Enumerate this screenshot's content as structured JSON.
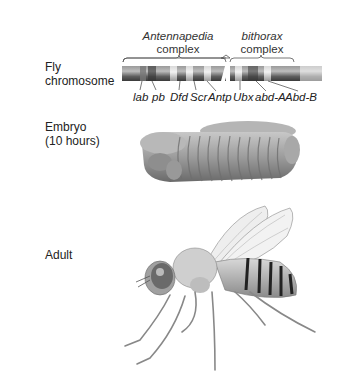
{
  "row_labels": {
    "chromosome": [
      "Fly",
      "chromosome"
    ],
    "embryo": [
      "Embryo",
      "(10 hours)"
    ],
    "adult": "Adult"
  },
  "complexes": [
    {
      "name": "Antennapedia",
      "suffix": "complex"
    },
    {
      "name": "bithorax",
      "suffix": "complex"
    }
  ],
  "genes": [
    "lab",
    "pb",
    "Dfd",
    "Scr",
    "Antp",
    "Ubx",
    "abd-A",
    "Abd-B"
  ],
  "colors": {
    "chromosome_dark": "#5a5a5a",
    "chromosome_light": "#c8c8c8",
    "band": "#e6e6e6",
    "embryo": "#9a9a9a",
    "fly_abdomen_stripe": "#222222"
  }
}
